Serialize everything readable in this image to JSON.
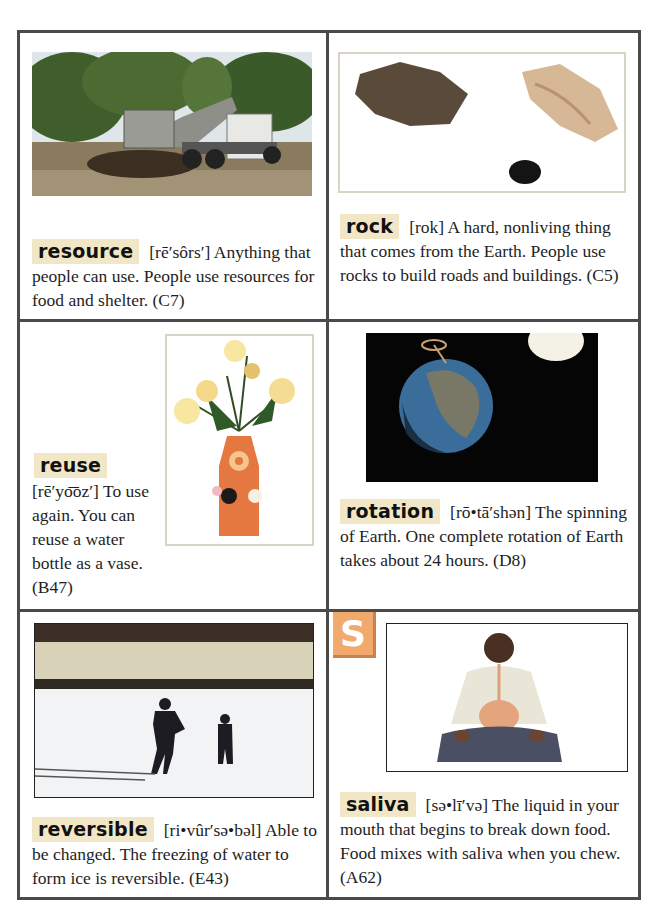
{
  "section_letter": "S",
  "accent_colors": {
    "frame": "#4a4a4a",
    "term_highlight": "#f1e7c6",
    "badge": "#f2a96d"
  },
  "entries": [
    {
      "term": "resource",
      "pronunciation": "[rē′sôrs′]",
      "definition": "Anything that people can use. People use resources for food and shelter.",
      "page_ref": "(C7)",
      "image": "dump-truck-unloading-soil"
    },
    {
      "term": "rock",
      "pronunciation": "[rok]",
      "definition": "A hard, nonliving thing that comes from the Earth. People use rocks to build roads and buildings.",
      "page_ref": "(C5)",
      "image": "three-rocks"
    },
    {
      "term": "reuse",
      "pronunciation": "[rē′yo͞oz′]",
      "definition": "To use again. You can reuse a water bottle as a vase.",
      "page_ref": "(B47)",
      "image": "bottle-vase-with-flowers"
    },
    {
      "term": "rotation",
      "pronunciation": "[rō•tā′shən]",
      "definition": "The spinning of Earth. One complete rotation of Earth takes about 24 hours.",
      "page_ref": "(D8)",
      "image": "earth-rotating-near-sun"
    },
    {
      "term": "reversible",
      "pronunciation": "[ri•vûr′sə•bəl]",
      "definition": "Able to be changed. The freezing of water to form ice is reversible.",
      "page_ref": "(E43)",
      "image": "children-skating-on-frozen-lake"
    },
    {
      "term": "saliva",
      "pronunciation": "[sə•lī′və]",
      "definition": "The liquid in your mouth that begins to break down food. Food mixes with saliva when you chew.",
      "page_ref": "(A62)",
      "image": "boy-with-digestive-system"
    }
  ]
}
